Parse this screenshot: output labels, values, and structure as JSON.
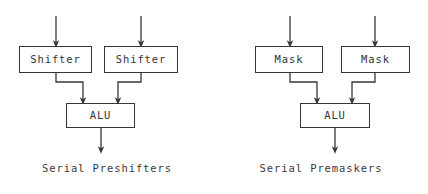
{
  "figure": {
    "background_color": "#ffffff",
    "line_color": "#363636",
    "text_color": "#333333",
    "diagrams": [
      {
        "id": "serial-preshifters",
        "caption": "Serial Preshifters",
        "nodes": [
          {
            "id": "shifter-left",
            "label": "Shifter",
            "x": 19,
            "y": 46,
            "w": 73,
            "h": 27
          },
          {
            "id": "shifter-right",
            "label": "Shifter",
            "x": 104,
            "y": 46,
            "w": 74,
            "h": 27
          },
          {
            "id": "alu",
            "label": "ALU",
            "x": 66,
            "y": 103,
            "w": 69,
            "h": 25
          }
        ],
        "edges": [
          {
            "id": "input-left",
            "from": "external",
            "to": "shifter-left",
            "path": "M56,16 L56,44",
            "arrow": true
          },
          {
            "id": "input-right",
            "from": "external",
            "to": "shifter-right",
            "path": "M141,16 L141,44",
            "arrow": true
          },
          {
            "id": "shifter-left-to-alu",
            "from": "shifter-left",
            "to": "alu",
            "path": "M56,73 L56,82 L83,82 L83,101",
            "arrow": true
          },
          {
            "id": "shifter-right-to-alu",
            "from": "shifter-right",
            "to": "alu",
            "path": "M141,73 L141,82 L118,82 L118,101",
            "arrow": true
          },
          {
            "id": "alu-output",
            "from": "alu",
            "to": "external",
            "path": "M101,128 L101,150",
            "arrow": true
          }
        ]
      },
      {
        "id": "serial-premaskers",
        "caption": "Serial Premaskers",
        "nodes": [
          {
            "id": "mask-left",
            "label": "Mask",
            "x": 41,
            "y": 46,
            "w": 68,
            "h": 27
          },
          {
            "id": "mask-right",
            "label": "Mask",
            "x": 127,
            "y": 46,
            "w": 69,
            "h": 27
          },
          {
            "id": "alu",
            "label": "ALU",
            "x": 86,
            "y": 103,
            "w": 70,
            "h": 25
          }
        ],
        "edges": [
          {
            "id": "input-left",
            "from": "external",
            "to": "mask-left",
            "path": "M76,16 L76,44",
            "arrow": true
          },
          {
            "id": "input-right",
            "from": "external",
            "to": "mask-right",
            "path": "M161,16 L161,44",
            "arrow": true
          },
          {
            "id": "mask-left-to-alu",
            "from": "mask-left",
            "to": "alu",
            "path": "M76,73 L76,82 L103,82 L103,101",
            "arrow": true
          },
          {
            "id": "mask-right-to-alu",
            "from": "mask-right",
            "to": "alu",
            "path": "M161,73 L161,82 L138,82 L138,101",
            "arrow": true
          },
          {
            "id": "alu-output",
            "from": "alu",
            "to": "external",
            "path": "M121,128 L121,150",
            "arrow": true
          }
        ]
      }
    ]
  }
}
